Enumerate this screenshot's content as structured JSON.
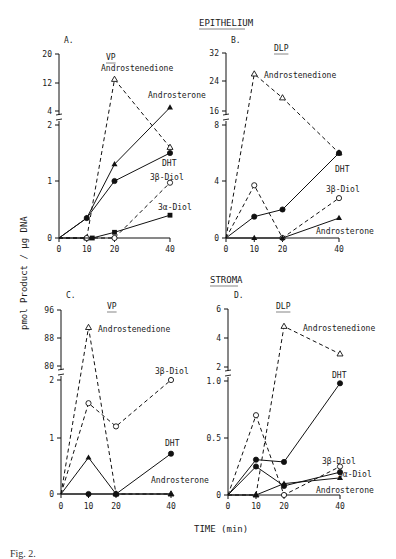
{
  "figure": {
    "ylabel": "pmol Product / µg DNA",
    "xlabel": "TIME (min)",
    "section_titles": [
      "EPITHELIUM",
      "STROMA"
    ],
    "caption": "Fig. 2."
  },
  "chart_data": [
    {
      "type": "line",
      "panel": "A.",
      "tissue": "EPITHELIUM",
      "title": "VP",
      "xlabel": "TIME (min)",
      "ylabel": "pmol Product / µg DNA",
      "x_ticks": [
        0,
        10,
        20,
        40
      ],
      "y_ticks": [
        "0",
        "1",
        "2",
        "4",
        "12",
        "20"
      ],
      "y_axis_break": "between 2 and 4",
      "series": [
        {
          "name": "Androstenedione",
          "style": "dashed",
          "marker": "open-triangle",
          "x": [
            0,
            10,
            20,
            40
          ],
          "y": [
            0,
            0,
            13,
            1.6
          ]
        },
        {
          "name": "Androsterone",
          "style": "solid",
          "marker": "filled-triangle",
          "x": [
            0,
            10,
            20,
            40
          ],
          "y": [
            0,
            0.35,
            1.3,
            5
          ]
        },
        {
          "name": "DHT",
          "style": "solid",
          "marker": "filled-circle",
          "x": [
            0,
            10,
            20,
            40
          ],
          "y": [
            0,
            0.35,
            1.0,
            1.5
          ]
        },
        {
          "name": "3β-Diol",
          "style": "dashed",
          "marker": "open-circle",
          "x": [
            0,
            10,
            20,
            40
          ],
          "y": [
            0,
            0,
            0,
            0.97
          ]
        },
        {
          "name": "3α-Diol",
          "style": "solid",
          "marker": "filled-square",
          "x": [
            0,
            12,
            20,
            40
          ],
          "y": [
            0,
            0,
            0.1,
            0.4
          ]
        }
      ]
    },
    {
      "type": "line",
      "panel": "B.",
      "tissue": "EPITHELIUM",
      "title": "DLP",
      "xlabel": "TIME (min)",
      "ylabel": "pmol Product / µg DNA",
      "x_ticks": [
        0,
        10,
        20,
        40
      ],
      "y_ticks": [
        "0",
        "4",
        "8",
        "16",
        "24",
        "32"
      ],
      "y_axis_break": "between 8 and 16",
      "series": [
        {
          "name": "Androstenedione",
          "style": "dashed",
          "marker": "open-triangle",
          "x": [
            0,
            10,
            20,
            40
          ],
          "y": [
            0,
            26,
            19.5,
            6
          ]
        },
        {
          "name": "DHT",
          "style": "solid",
          "marker": "filled-circle",
          "x": [
            0,
            10,
            20,
            40
          ],
          "y": [
            0,
            1.5,
            2.0,
            6
          ]
        },
        {
          "name": "3β-Diol",
          "style": "dashed",
          "marker": "open-circle",
          "x": [
            0,
            10,
            20,
            40
          ],
          "y": [
            0,
            3.7,
            0,
            2.8
          ]
        },
        {
          "name": "Androsterone",
          "style": "solid",
          "marker": "filled-triangle",
          "x": [
            0,
            10,
            20,
            40
          ],
          "y": [
            0,
            0,
            0,
            1.4
          ]
        }
      ]
    },
    {
      "type": "line",
      "panel": "C.",
      "tissue": "STROMA",
      "title": "VP",
      "xlabel": "TIME (min)",
      "ylabel": "pmol Product / µg DNA",
      "x_ticks": [
        0,
        10,
        20,
        40
      ],
      "y_ticks": [
        "0",
        "1",
        "2",
        "80",
        "88",
        "96"
      ],
      "y_axis_break": "between 2 and 80",
      "series": [
        {
          "name": "Androstenedione",
          "style": "dashed",
          "marker": "open-triangle",
          "x": [
            0,
            10,
            20,
            40
          ],
          "y": [
            0,
            91,
            0,
            0
          ]
        },
        {
          "name": "3β-Diol",
          "style": "dashed",
          "marker": "open-circle",
          "x": [
            0,
            10,
            20,
            40
          ],
          "y": [
            0,
            1.6,
            1.2,
            2.0
          ]
        },
        {
          "name": "Androsterone",
          "style": "solid",
          "marker": "filled-triangle",
          "x": [
            0,
            10,
            20,
            40
          ],
          "y": [
            0,
            0.65,
            0,
            0
          ]
        },
        {
          "name": "DHT",
          "style": "solid",
          "marker": "filled-circle",
          "x": [
            0,
            10,
            20,
            40
          ],
          "y": [
            0,
            0,
            0,
            0.72
          ]
        }
      ]
    },
    {
      "type": "line",
      "panel": "D.",
      "tissue": "STROMA",
      "title": "DLP",
      "xlabel": "TIME (min)",
      "ylabel": "pmol Product / µg DNA",
      "x_ticks": [
        0,
        10,
        20,
        40
      ],
      "y_ticks": [
        "0",
        "0.5",
        "1.0",
        "2",
        "4",
        "6"
      ],
      "y_axis_break": "between 1.0 and 2",
      "series": [
        {
          "name": "Androstenedione",
          "style": "dashed",
          "marker": "open-triangle",
          "x": [
            0,
            10,
            20,
            40
          ],
          "y": [
            0,
            0,
            4.8,
            2.9
          ]
        },
        {
          "name": "DHT",
          "style": "solid",
          "marker": "filled-circle",
          "x": [
            0,
            10,
            20,
            40
          ],
          "y": [
            0,
            0.31,
            0.29,
            0.98
          ]
        },
        {
          "name": "3β-Diol",
          "style": "dashed",
          "marker": "open-circle",
          "x": [
            0,
            10,
            20,
            40
          ],
          "y": [
            0,
            0.7,
            0,
            0.25
          ]
        },
        {
          "name": "3α-Diol",
          "style": "solid",
          "marker": "filled-circle",
          "x": [
            0,
            10,
            20,
            40
          ],
          "y": [
            0,
            0.25,
            0.08,
            0.2
          ]
        },
        {
          "name": "Androsterone",
          "style": "solid",
          "marker": "filled-triangle",
          "x": [
            0,
            10,
            20,
            40
          ],
          "y": [
            0,
            0,
            0.1,
            0.15
          ]
        }
      ]
    }
  ]
}
